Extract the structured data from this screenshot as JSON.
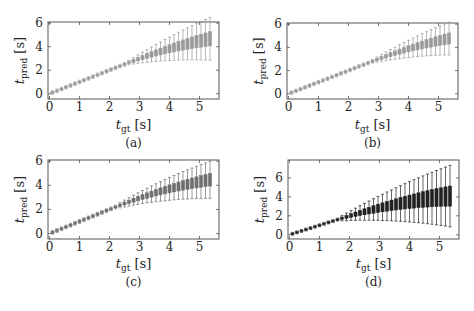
{
  "figure": {
    "panels": [
      {
        "id": "a",
        "caption": "(a)"
      },
      {
        "id": "b",
        "caption": "(b)"
      },
      {
        "id": "c",
        "caption": "(c)"
      },
      {
        "id": "d",
        "caption": "(d)"
      }
    ]
  },
  "chart_data": [
    {
      "type": "boxplot",
      "panel": "a",
      "caption": "(a)",
      "xlabel": "t_gt [s]",
      "ylabel": "t_pred [s]",
      "xticks": [
        0,
        1,
        2,
        3,
        4,
        5
      ],
      "yticks": [
        0,
        2,
        4,
        6
      ],
      "xlim": [
        -0.05,
        5.65
      ],
      "ylim": [
        -0.45,
        6.1
      ],
      "color": "#9a9a9a",
      "grid": false,
      "spread_start": 2.6,
      "spread_scale": 0.55,
      "saturation": 5.0
    },
    {
      "type": "boxplot",
      "panel": "b",
      "caption": "(b)",
      "xlabel": "t_gt [s]",
      "ylabel": "t_pred [s]",
      "xticks": [
        0,
        1,
        2,
        3,
        4,
        5
      ],
      "yticks": [
        0,
        2,
        4,
        6
      ],
      "xlim": [
        -0.05,
        5.65
      ],
      "ylim": [
        -0.45,
        6.1
      ],
      "color": "#9a9a9a",
      "grid": false,
      "spread_start": 2.8,
      "spread_scale": 0.45,
      "saturation": 5.0
    },
    {
      "type": "boxplot",
      "panel": "c",
      "caption": "(c)",
      "xlabel": "t_gt [s]",
      "ylabel": "t_pred [s]",
      "xticks": [
        0,
        1,
        2,
        3,
        4,
        5
      ],
      "yticks": [
        0,
        2,
        4,
        6
      ],
      "xlim": [
        -0.05,
        5.65
      ],
      "ylim": [
        -0.45,
        6.1
      ],
      "color": "#6f6f6f",
      "grid": false,
      "spread_start": 2.2,
      "spread_scale": 0.4,
      "saturation": 4.9
    },
    {
      "type": "boxplot",
      "panel": "d",
      "caption": "(d)",
      "xlabel": "t_gt [s]",
      "ylabel": "t_pred [s]",
      "xticks": [
        0,
        1,
        2,
        3,
        4,
        5
      ],
      "yticks": [
        0,
        2,
        4,
        6
      ],
      "xlim": [
        -0.05,
        5.65
      ],
      "ylim": [
        -0.45,
        7.9
      ],
      "color": "#222222",
      "grid": false,
      "spread_start": 1.6,
      "spread_scale": 0.75,
      "saturation": 5.6
    }
  ],
  "box_positions": [
    0.1,
    0.25,
    0.4,
    0.55,
    0.7,
    0.85,
    1.0,
    1.15,
    1.3,
    1.45,
    1.6,
    1.75,
    1.9,
    2.05,
    2.2,
    2.35,
    2.5,
    2.65,
    2.8,
    2.95,
    3.1,
    3.25,
    3.4,
    3.55,
    3.7,
    3.85,
    4.0,
    4.15,
    4.3,
    4.45,
    4.6,
    4.75,
    4.9,
    5.05,
    5.2,
    5.35
  ]
}
